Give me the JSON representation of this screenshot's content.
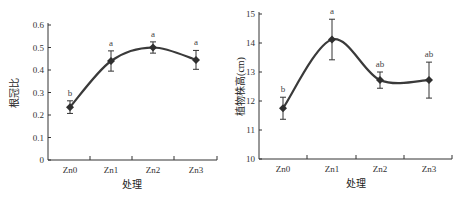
{
  "chart_data": [
    {
      "type": "line",
      "title": "",
      "xlabel": "处理",
      "ylabel": "根冠比",
      "categories": [
        "Zn0",
        "Zn1",
        "Zn2",
        "Zn3"
      ],
      "values": [
        0.235,
        0.44,
        0.5,
        0.445
      ],
      "errors": [
        0.028,
        0.045,
        0.025,
        0.042
      ],
      "significance": [
        "b",
        "a",
        "a",
        "a"
      ],
      "ylim": [
        0,
        0.6
      ],
      "yticks": [
        "0",
        "0.1",
        "0.2",
        "0.3",
        "0.4",
        "0.5",
        "0.6"
      ],
      "grid": false,
      "marker": "diamond",
      "smooth": true
    },
    {
      "type": "line",
      "title": "",
      "xlabel": "处理",
      "ylabel": "植物株高(cm)",
      "categories": [
        "Zn0",
        "Zn1",
        "Zn2",
        "Zn3"
      ],
      "values": [
        11.75,
        14.12,
        12.72,
        12.72
      ],
      "errors": [
        0.38,
        0.7,
        0.28,
        0.62
      ],
      "significance": [
        "b",
        "a",
        "ab",
        "ab"
      ],
      "ylim": [
        10,
        15
      ],
      "yticks": [
        "10",
        "11",
        "12",
        "13",
        "14",
        "15"
      ],
      "grid": false,
      "marker": "diamond",
      "smooth": true
    }
  ]
}
